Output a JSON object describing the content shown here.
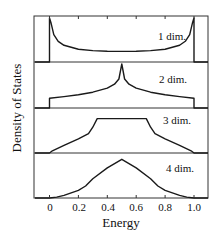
{
  "chart_data": {
    "type": "line",
    "title": "",
    "xlabel": "Energy",
    "ylabel": "Density of States",
    "xlim": [
      -0.1,
      1.1
    ],
    "xticks": [
      0,
      0.2,
      0.4,
      0.6,
      0.8,
      1.0
    ],
    "xtick_labels": [
      "0",
      "0.2",
      "0.4",
      "0.6",
      "0.8",
      "1.0"
    ],
    "grid": false,
    "legend": "none (inline panel labels)",
    "panels": [
      {
        "label": "1 dim.",
        "description": "U-shaped curve with divergences at band edges 0 and 1.0; zero outside band",
        "x": [
          -0.1,
          0.0,
          0.0,
          0.01,
          0.03,
          0.06,
          0.1,
          0.2,
          0.3,
          0.4,
          0.5,
          0.6,
          0.7,
          0.8,
          0.9,
          0.94,
          0.97,
          0.99,
          1.0,
          1.0,
          1.1
        ],
        "y": [
          0.0,
          0.0,
          1.0,
          0.9,
          0.62,
          0.47,
          0.38,
          0.29,
          0.26,
          0.245,
          0.24,
          0.245,
          0.26,
          0.29,
          0.38,
          0.47,
          0.62,
          0.9,
          1.0,
          0.0,
          0.0
        ]
      },
      {
        "label": "2 dim.",
        "description": "Step at band edges, logarithmic peak at center 0.5",
        "x": [
          -0.1,
          0.0,
          0.0,
          0.1,
          0.2,
          0.3,
          0.4,
          0.45,
          0.48,
          0.5,
          0.52,
          0.55,
          0.6,
          0.7,
          0.8,
          0.9,
          1.0,
          1.0,
          1.1
        ],
        "y": [
          0.0,
          0.0,
          0.22,
          0.26,
          0.3,
          0.36,
          0.45,
          0.54,
          0.66,
          1.0,
          0.66,
          0.54,
          0.45,
          0.36,
          0.3,
          0.26,
          0.22,
          0.0,
          0.0
        ]
      },
      {
        "label": "3 dim.",
        "description": "Square-root onset at edges, flat plateau between ~1/3 and ~2/3",
        "x": [
          -0.1,
          0.0,
          0.02,
          0.1,
          0.2,
          0.27,
          0.3,
          0.33,
          0.5,
          0.67,
          0.7,
          0.73,
          0.8,
          0.9,
          0.98,
          1.0,
          1.1
        ],
        "y": [
          0.0,
          0.0,
          0.05,
          0.18,
          0.33,
          0.45,
          0.6,
          0.8,
          0.8,
          0.8,
          0.6,
          0.45,
          0.33,
          0.18,
          0.05,
          0.0,
          0.0
        ]
      },
      {
        "label": "4 dim.",
        "description": "Smooth hump with cusp peak at 0.5",
        "x": [
          -0.1,
          0.0,
          0.05,
          0.1,
          0.2,
          0.25,
          0.3,
          0.4,
          0.5,
          0.6,
          0.7,
          0.75,
          0.8,
          0.9,
          0.95,
          1.0,
          1.1
        ],
        "y": [
          0.0,
          0.0,
          0.02,
          0.06,
          0.18,
          0.28,
          0.45,
          0.7,
          0.9,
          0.7,
          0.45,
          0.28,
          0.18,
          0.06,
          0.02,
          0.0,
          0.0
        ]
      }
    ]
  },
  "labels": {
    "ylabel": "Density of States",
    "xlabel": "Energy",
    "xtick_labels": [
      "0",
      "0.2",
      "0.4",
      "0.6",
      "0.8",
      "1.0"
    ],
    "panel_labels": [
      "1 dim.",
      "2 dim.",
      "3 dim.",
      "4 dim."
    ]
  },
  "colors": {
    "line": "#1a1a1a",
    "frame": "#333333",
    "background": "#ffffff"
  }
}
